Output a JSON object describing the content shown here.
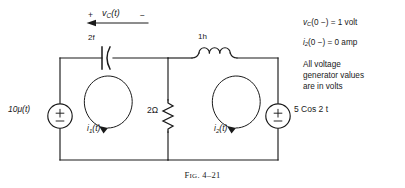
{
  "figure": {
    "caption_prefix": "F",
    "caption_smallcaps": "IG",
    "caption_rest": ". 4–21"
  },
  "circuit": {
    "capacitor": {
      "value": "2f",
      "name": "capacitor"
    },
    "inductor": {
      "value": "1h",
      "name": "inductor"
    },
    "resistor": {
      "value": "2Ω",
      "name": "resistor"
    },
    "source_left": {
      "value": "10μ(t)",
      "polarity": "±"
    },
    "source_right": {
      "value": "5 Cos 2 t",
      "polarity": "±"
    },
    "capacitor_voltage": {
      "plus": "+",
      "name": "v",
      "subscript": "C",
      "arg": "(t)",
      "minus": "−"
    },
    "mesh_current_1": {
      "name": "i",
      "subscript": "1",
      "arg": "(t)"
    },
    "mesh_current_2": {
      "name": "i",
      "subscript": "2",
      "arg": "(t)"
    }
  },
  "notes": {
    "initial_voltage": "v_C(0−) = 1 volt",
    "initial_voltage_parts": {
      "name": "v",
      "subscript": "C",
      "rest": "(0 −) = 1 volt"
    },
    "initial_current_parts": {
      "name": "i",
      "subscript": "2",
      "rest": "(0 −) = 0 amp"
    },
    "paragraph": [
      "All voltage",
      "generator values",
      "are in volts"
    ]
  },
  "colors": {
    "wire": "#1a1a1a",
    "text": "#1a1a1a",
    "background": "#ffffff"
  }
}
